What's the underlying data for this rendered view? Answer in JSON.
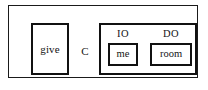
{
  "diagram": {
    "type": "syntactic-constituent-box-diagram",
    "outer_box": {
      "name": "clause-box"
    },
    "verb": {
      "text": "give"
    },
    "head": {
      "label": "C"
    },
    "object_shell": {
      "arguments": [
        {
          "label": "IO",
          "text": "me"
        },
        {
          "label": "DO",
          "text": "room"
        }
      ]
    },
    "colors": {
      "stroke": "#111111",
      "outer_stroke": "#1a1a1a",
      "text": "#141414",
      "background": "#ffffff"
    }
  }
}
